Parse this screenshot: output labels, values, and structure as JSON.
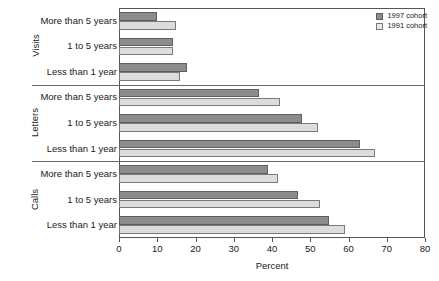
{
  "chart_data": {
    "type": "bar",
    "orientation": "horizontal",
    "title": "",
    "xlabel": "Percent",
    "ylabel": "",
    "xlim": [
      0,
      80
    ],
    "xticks": [
      0,
      10,
      20,
      30,
      40,
      50,
      60,
      70,
      80
    ],
    "grid": false,
    "legend_position": "top-right",
    "series": [
      {
        "name": "1997 cohort",
        "color": "#8c8c8c"
      },
      {
        "name": "1991 cohort",
        "color": "#dcdcdc"
      }
    ],
    "groups": [
      {
        "name": "Visits",
        "categories": [
          "More than 5 years",
          "1 to 5 years",
          "Less than 1 year"
        ],
        "values_1997": [
          10,
          14,
          17.8
        ],
        "values_1991": [
          14.8,
          14,
          16
        ]
      },
      {
        "name": "Letters",
        "categories": [
          "More than 5 years",
          "1 to 5 years",
          "Less than 1 year"
        ],
        "values_1997": [
          36.6,
          47.8,
          63
        ],
        "values_1991": [
          42,
          52,
          67
        ]
      },
      {
        "name": "Calls",
        "categories": [
          "More than 5 years",
          "1 to 5 years",
          "Less than 1 year"
        ],
        "values_1997": [
          39,
          46.7,
          55
        ],
        "values_1991": [
          41.5,
          52.5,
          59
        ]
      }
    ]
  },
  "legend": {
    "items": [
      {
        "label": "1997 cohort"
      },
      {
        "label": "1991 cohort"
      }
    ]
  },
  "axis": {
    "title": "Percent",
    "tick_labels": [
      "0",
      "10",
      "20",
      "30",
      "40",
      "50",
      "60",
      "70",
      "80"
    ]
  }
}
